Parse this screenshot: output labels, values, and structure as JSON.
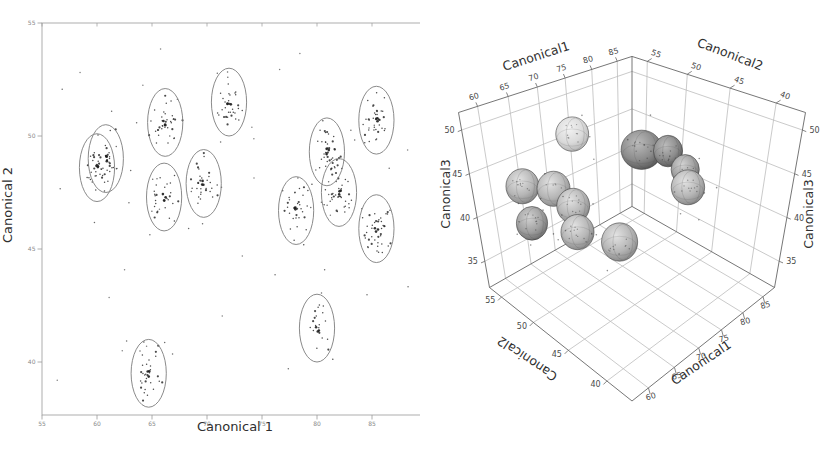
{
  "figure": {
    "background": "#ffffff"
  },
  "chart_data": [
    {
      "type": "scatter",
      "panel": "left",
      "title": "",
      "xlabel": "Canonical 1",
      "ylabel": "Canonical 2",
      "xlim": [
        55,
        90
      ],
      "ylim": [
        37.6,
        55
      ],
      "xticks": [
        55,
        60,
        65,
        70,
        75,
        80,
        85,
        90
      ],
      "yticks": [
        40,
        45,
        50,
        55
      ],
      "grid": false,
      "frame": true,
      "ellipse_rx": 1.6,
      "ellipse_ry": 1.5,
      "point_color": "#2b2b2b",
      "ellipse_color": "#7d7d7d",
      "axis_color": "#9a9a9a",
      "tick_label_color": "#8a8a8a",
      "title_color": "#2f2f2f",
      "clusters": [
        {
          "cx": 60.0,
          "cy": 48.6,
          "n": 28,
          "seed": 11
        },
        {
          "cx": 60.8,
          "cy": 49.0,
          "n": 22,
          "seed": 23
        },
        {
          "cx": 66.2,
          "cy": 50.6,
          "n": 34,
          "seed": 37
        },
        {
          "cx": 72.0,
          "cy": 51.5,
          "n": 30,
          "seed": 41
        },
        {
          "cx": 66.1,
          "cy": 47.3,
          "n": 26,
          "seed": 53
        },
        {
          "cx": 69.7,
          "cy": 47.9,
          "n": 30,
          "seed": 67
        },
        {
          "cx": 78.1,
          "cy": 46.7,
          "n": 30,
          "seed": 71
        },
        {
          "cx": 80.9,
          "cy": 49.3,
          "n": 36,
          "seed": 83
        },
        {
          "cx": 82.0,
          "cy": 47.5,
          "n": 38,
          "seed": 97
        },
        {
          "cx": 85.4,
          "cy": 50.7,
          "n": 34,
          "seed": 101
        },
        {
          "cx": 85.4,
          "cy": 45.9,
          "n": 40,
          "seed": 113
        },
        {
          "cx": 80.0,
          "cy": 41.5,
          "n": 20,
          "seed": 127
        },
        {
          "cx": 64.7,
          "cy": 39.5,
          "n": 30,
          "seed": 131
        }
      ],
      "outliers": {
        "n": 18,
        "seed": 7,
        "per_cluster_strays": 4
      }
    },
    {
      "type": "scatter3d",
      "panel": "right",
      "xlabel": "Canonical1",
      "ylabel": "Canonical2",
      "zlabel_left": "Canonical3",
      "zlabel_right": "Canonical3",
      "xlim": [
        57,
        88
      ],
      "ylim": [
        37,
        57
      ],
      "zlim": [
        32,
        52
      ],
      "xticks": [
        60,
        65,
        70,
        75,
        80,
        85
      ],
      "yticks": [
        40,
        45,
        50,
        55
      ],
      "zticks": [
        35,
        40,
        45,
        50
      ],
      "grid_color": "#bdbdbd",
      "edge_color": "#666666",
      "tick_label_color": "#4a4a4a",
      "title_color": "#303030",
      "shades": {
        "light": [
          "#f3f3f3",
          "#dadada",
          "#a9a9a9"
        ],
        "mid": [
          "#e3e3e3",
          "#b6b6b6",
          "#7a7a7a"
        ],
        "middark": [
          "#d2d2d2",
          "#a0a0a0",
          "#606060"
        ],
        "dark": [
          "#bcbcbc",
          "#8c8c8c",
          "#484848"
        ]
      },
      "ellipsoids": [
        {
          "x": 71.6,
          "y": 54.0,
          "z": 47.0,
          "r1": 3.4,
          "r3": 2.3,
          "shade": "light"
        },
        {
          "x": 77.5,
          "y": 49.0,
          "z": 45.6,
          "r1": 4.2,
          "r3": 2.6,
          "shade": "dark"
        },
        {
          "x": 80.6,
          "y": 47.6,
          "z": 45.2,
          "r1": 3.0,
          "r3": 2.1,
          "shade": "dark"
        },
        {
          "x": 82.4,
          "y": 46.4,
          "z": 43.0,
          "r1": 2.9,
          "r3": 2.0,
          "shade": "middark"
        },
        {
          "x": 81.8,
          "y": 45.6,
          "z": 41.4,
          "r1": 3.4,
          "r3": 2.3,
          "shade": "mid"
        },
        {
          "x": 61.0,
          "y": 53.0,
          "z": 44.2,
          "r1": 3.2,
          "r3": 2.2,
          "shade": "mid"
        },
        {
          "x": 63.8,
          "y": 51.0,
          "z": 44.0,
          "r1": 3.2,
          "r3": 2.2,
          "shade": "mid"
        },
        {
          "x": 61.0,
          "y": 52.2,
          "z": 40.4,
          "r1": 3.0,
          "r3": 2.1,
          "shade": "middark"
        },
        {
          "x": 66.0,
          "y": 50.2,
          "z": 41.8,
          "r1": 3.2,
          "r3": 2.2,
          "shade": "mid"
        },
        {
          "x": 65.7,
          "y": 49.6,
          "z": 39.2,
          "r1": 3.2,
          "r3": 2.2,
          "shade": "mid"
        },
        {
          "x": 70.0,
          "y": 47.0,
          "z": 38.0,
          "r1": 3.5,
          "r3": 2.4,
          "shade": "mid"
        }
      ],
      "stray_points": {
        "per_ellipsoid": 3,
        "seed": 5
      }
    }
  ]
}
